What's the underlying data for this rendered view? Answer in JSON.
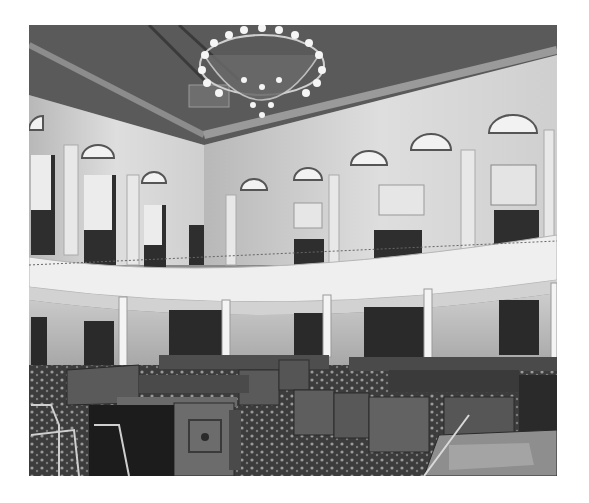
{
  "image": {
    "subject": "legislative-chamber-interior",
    "tone": "black-and-white",
    "elements": {
      "ceiling": "coffered-ceiling",
      "chandelier": "crystal-chandelier",
      "upper_level": "gallery-with-balcony",
      "windows": "arched-lunette-windows",
      "columns": "white-columns",
      "floor": "patterned-carpet",
      "furniture": [
        "rostrum",
        "wooden-desks",
        "chairs"
      ]
    },
    "colors": {
      "background": "#ffffff",
      "ceiling": "#5e5e5e",
      "walls": "#d9d9d9",
      "balcony": "#eeeeee",
      "wood": "#3a3a3a",
      "carpet": "#4a4a4a"
    }
  }
}
